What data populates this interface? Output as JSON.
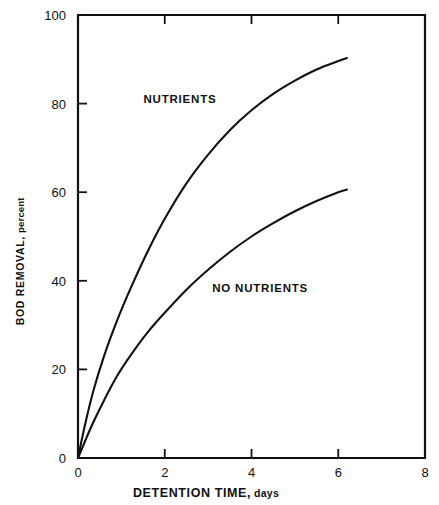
{
  "chart_data": {
    "type": "line",
    "title": "",
    "xlabel": "DETENTION TIME, days",
    "xlabel_main": "DETENTION TIME,",
    "xlabel_sub": "days",
    "ylabel": "BOD REMOVAL, percent",
    "ylabel_main": "BOD REMOVAL,",
    "ylabel_sub": "percent",
    "xlim": [
      0,
      8
    ],
    "ylim": [
      0,
      100
    ],
    "xticks": [
      0,
      2,
      4,
      6,
      8
    ],
    "xticklabels": [
      "0",
      "2",
      "4",
      "6",
      "8"
    ],
    "yticks": [
      0,
      20,
      40,
      60,
      80,
      100
    ],
    "yticklabels": [
      "0",
      "20",
      "40",
      "60",
      "80",
      "100"
    ],
    "grid": false,
    "legend_position": "inline-annotations",
    "frame": "box",
    "series": [
      {
        "name": "NUTRIENTS",
        "label_x": 2.35,
        "label_y": 80.2,
        "x": [
          0.0,
          0.15,
          0.35,
          0.6,
          0.9,
          1.2,
          1.6,
          2.0,
          2.5,
          3.0,
          3.5,
          4.0,
          4.5,
          5.0,
          5.5,
          6.0,
          6.2
        ],
        "y": [
          0.0,
          7.0,
          15.0,
          23.0,
          31.0,
          38.0,
          46.5,
          54.0,
          62.0,
          68.5,
          74.0,
          78.5,
          82.2,
          85.2,
          87.7,
          89.6,
          90.3
        ]
      },
      {
        "name": "NO NUTRIENTS",
        "label_x": 4.2,
        "label_y": 37.4,
        "x": [
          0.0,
          0.15,
          0.35,
          0.6,
          0.9,
          1.2,
          1.6,
          2.0,
          2.5,
          3.0,
          3.5,
          4.0,
          4.5,
          5.0,
          5.5,
          6.0,
          6.2
        ],
        "y": [
          0.0,
          3.5,
          8.0,
          13.0,
          18.5,
          23.0,
          28.3,
          32.8,
          38.0,
          42.5,
          46.5,
          50.0,
          53.0,
          55.7,
          58.0,
          60.0,
          60.6
        ]
      }
    ],
    "colors": {
      "axis": "#111111",
      "curve": "#111111",
      "background": "#ffffff"
    }
  },
  "caption": {
    "partial_top_text": ""
  }
}
